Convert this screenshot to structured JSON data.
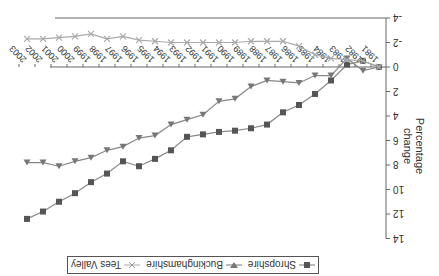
{
  "chart_data": {
    "type": "line",
    "title": "",
    "xlabel": "",
    "ylabel": "Percentage change",
    "ylim": [
      -4,
      14
    ],
    "yticks": [
      -4,
      -2,
      0,
      2,
      4,
      6,
      8,
      10,
      12,
      14
    ],
    "grid": false,
    "legend_position": "bottom",
    "orientation_note": "image rendered rotated 180 degrees",
    "categories": [
      "1981",
      "1982",
      "1983",
      "1984",
      "1985",
      "1986",
      "1987",
      "1988",
      "1989",
      "1990",
      "1991",
      "1992",
      "1993",
      "1994",
      "1995",
      "1996",
      "1997",
      "1998",
      "1999",
      "2000",
      "2001",
      "2002",
      "2003"
    ],
    "series": [
      {
        "name": "Shropshire",
        "marker": "square",
        "color": "#555555",
        "values": [
          0,
          -0.5,
          -0.2,
          1.1,
          2.2,
          3.1,
          3.7,
          4.7,
          5.0,
          5.2,
          5.3,
          5.5,
          5.7,
          6.8,
          7.5,
          8.1,
          7.7,
          8.7,
          9.4,
          10.3,
          11.0,
          11.8,
          12.4
        ]
      },
      {
        "name": "Buckinghamshire",
        "marker": "triangle-down",
        "color": "#777777",
        "values": [
          0,
          0.3,
          -0.7,
          0.7,
          0.7,
          1.3,
          1.2,
          1.1,
          1.6,
          2.6,
          2.8,
          3.9,
          4.3,
          4.7,
          5.6,
          5.8,
          6.5,
          6.8,
          7.4,
          7.7,
          8.1,
          7.8,
          7.8
        ]
      },
      {
        "name": "Tees Valley",
        "marker": "x",
        "color": "#aaaaaa",
        "values": [
          0,
          -0.5,
          -0.6,
          -0.7,
          -1.0,
          -1.7,
          -2.1,
          -2.1,
          -2.1,
          -2.0,
          -2.0,
          -2.0,
          -2.0,
          -2.0,
          -2.1,
          -2.2,
          -2.5,
          -2.3,
          -2.7,
          -2.5,
          -2.4,
          -2.3,
          -2.3
        ]
      }
    ]
  },
  "legend": {
    "items": [
      {
        "label": "Shropshire"
      },
      {
        "label": "Buckinghamshire"
      },
      {
        "label": "Tees Valley"
      }
    ]
  },
  "axis": {
    "ylabel": "Percentage change"
  }
}
